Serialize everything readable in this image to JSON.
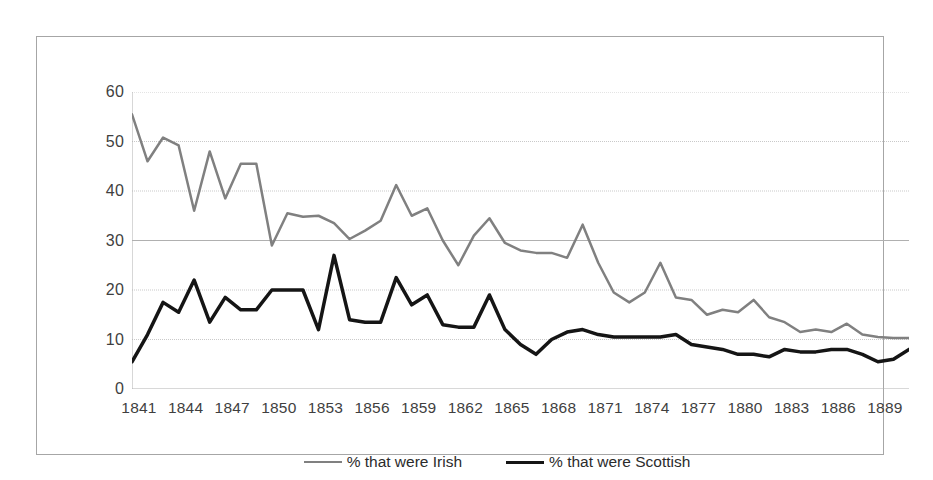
{
  "chart_data": {
    "type": "line",
    "title": "",
    "subtitle": "",
    "xlabel": "",
    "ylabel": "",
    "xlim": [
      1841,
      1891
    ],
    "ylim": [
      0,
      60
    ],
    "yticks": [
      0,
      10,
      20,
      30,
      40,
      50,
      60
    ],
    "grid": "horizontal",
    "legend_position": "bottom-center",
    "x": [
      1841,
      1842,
      1843,
      1844,
      1845,
      1846,
      1847,
      1848,
      1849,
      1850,
      1851,
      1852,
      1853,
      1854,
      1855,
      1856,
      1857,
      1858,
      1859,
      1860,
      1861,
      1862,
      1863,
      1864,
      1865,
      1866,
      1867,
      1868,
      1869,
      1870,
      1871,
      1872,
      1873,
      1874,
      1875,
      1876,
      1877,
      1878,
      1879,
      1880,
      1881,
      1882,
      1883,
      1884,
      1885,
      1886,
      1887,
      1888,
      1889,
      1890,
      1891
    ],
    "xticks": [
      1841,
      1844,
      1847,
      1850,
      1853,
      1856,
      1859,
      1862,
      1865,
      1868,
      1871,
      1874,
      1877,
      1880,
      1883,
      1886,
      1889
    ],
    "xtick_labels": [
      "1841",
      "1844",
      "1847",
      "1850",
      "1853",
      "1856",
      "1859",
      "1862",
      "1865",
      "1868",
      "1871",
      "1874",
      "1877",
      "1880",
      "1883",
      "1886",
      "1889"
    ],
    "series": [
      {
        "name": "% that were Irish",
        "color": "#808080",
        "width": 2.5,
        "values": [
          55.5,
          46.0,
          50.8,
          49.2,
          36.0,
          48.0,
          38.5,
          45.5,
          45.5,
          29.0,
          35.5,
          34.8,
          35.0,
          33.5,
          30.3,
          32.0,
          34.0,
          41.2,
          35.0,
          36.5,
          30.0,
          25.0,
          31.0,
          34.5,
          29.5,
          28.0,
          27.5,
          27.5,
          26.5,
          33.2,
          25.5,
          19.5,
          17.5,
          19.5,
          25.5,
          18.5,
          18.0,
          15.0,
          16.0,
          15.5,
          18.0,
          14.5,
          13.5,
          11.5,
          12.0,
          11.5,
          13.2,
          11.0,
          10.5,
          10.3,
          10.3
        ]
      },
      {
        "name": "% that were Scottish",
        "color": "#151515",
        "width": 3.5,
        "values": [
          5.5,
          11.0,
          17.5,
          15.5,
          22.0,
          13.5,
          18.5,
          16.0,
          16.0,
          20.0,
          20.0,
          20.0,
          12.0,
          27.0,
          14.0,
          13.5,
          13.5,
          22.5,
          17.0,
          19.0,
          13.0,
          12.5,
          12.5,
          19.0,
          12.0,
          9.0,
          7.0,
          10.0,
          11.5,
          12.0,
          11.0,
          10.5,
          10.5,
          10.5,
          10.5,
          11.0,
          9.0,
          8.5,
          8.0,
          7.0,
          7.0,
          6.5,
          8.0,
          7.5,
          7.5,
          8.0,
          8.0,
          7.0,
          5.5,
          6.0,
          8.0
        ]
      }
    ],
    "legend": [
      {
        "label": "% that were Irish",
        "color": "#808080"
      },
      {
        "label": "% that were Scottish",
        "color": "#151515"
      }
    ]
  }
}
